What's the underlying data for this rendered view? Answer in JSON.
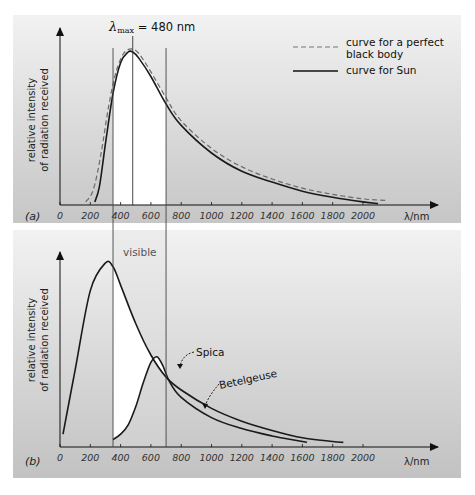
{
  "figure": {
    "colors": {
      "panel_bg_top": "#f0f0f0",
      "panel_bg_bottom": "#c4c4c4",
      "visible_band": "#ffffff",
      "curve": "#1a1a1a",
      "dashed_curve": "#777777"
    }
  },
  "chart_data": [
    {
      "type": "line",
      "panel_label": "(a)",
      "title": "λmax = 480 nm",
      "title_parts": {
        "lambda": "λ",
        "sub": "max",
        "rest": " = 480 nm"
      },
      "xlabel": "λ/nm",
      "ylabel": [
        "relative intensity",
        "of radiation received"
      ],
      "x_ticks": [
        0,
        200,
        400,
        600,
        800,
        1000,
        1200,
        1400,
        1600,
        1800,
        2000
      ],
      "xlim": [
        0,
        2500
      ],
      "grid": false,
      "legend_position": "upper right",
      "legend": [
        {
          "label_lines": [
            "curve for a perfect",
            "black body"
          ],
          "style": "dashed"
        },
        {
          "label_lines": [
            "curve for Sun"
          ],
          "style": "solid"
        }
      ],
      "vertical_lines_nm": [
        350,
        480,
        700
      ],
      "shaded_region_nm": [
        350,
        700
      ],
      "series": [
        {
          "name": "curve for Sun",
          "style": "solid",
          "x": [
            230,
            260,
            300,
            350,
            400,
            450,
            480,
            520,
            600,
            700,
            800,
            1000,
            1200,
            1400,
            1600,
            1800,
            2000,
            2100
          ],
          "y": [
            0.02,
            0.12,
            0.4,
            0.73,
            0.93,
            1.0,
            1.0,
            0.96,
            0.84,
            0.66,
            0.52,
            0.34,
            0.22,
            0.15,
            0.09,
            0.05,
            0.02,
            0.01
          ]
        },
        {
          "name": "curve for a perfect black body",
          "style": "dashed",
          "x": [
            170,
            220,
            270,
            320,
            370,
            420,
            470,
            520,
            600,
            700,
            800,
            1000,
            1200,
            1400,
            1600,
            1800,
            2000,
            2150
          ],
          "y": [
            0.02,
            0.1,
            0.33,
            0.64,
            0.87,
            0.99,
            1.02,
            0.99,
            0.87,
            0.7,
            0.55,
            0.37,
            0.25,
            0.17,
            0.11,
            0.07,
            0.04,
            0.03
          ]
        }
      ]
    },
    {
      "type": "line",
      "panel_label": "(b)",
      "xlabel": "λ/nm",
      "ylabel": [
        "relative intensity",
        "of radiation received"
      ],
      "x_ticks": [
        0,
        200,
        400,
        600,
        800,
        1000,
        1200,
        1400,
        1600,
        1800,
        2000
      ],
      "xlim": [
        0,
        2500
      ],
      "grid": false,
      "annotations": [
        "visible",
        "Spica",
        "Betelgeuse"
      ],
      "vertical_lines_nm": [
        350,
        700
      ],
      "shaded_region_nm": [
        350,
        700
      ],
      "series": [
        {
          "name": "Spica",
          "x": [
            20,
            100,
            200,
            300,
            350,
            400,
            500,
            600,
            700,
            800,
            1000,
            1200,
            1400,
            1600,
            1800,
            1870
          ],
          "y": [
            0.07,
            0.42,
            0.85,
            1.0,
            0.98,
            0.88,
            0.67,
            0.5,
            0.38,
            0.31,
            0.21,
            0.14,
            0.09,
            0.05,
            0.03,
            0.025
          ]
        },
        {
          "name": "Betelgeuse",
          "x": [
            350,
            400,
            450,
            500,
            550,
            600,
            640,
            680,
            720,
            800,
            1000,
            1200,
            1400,
            1600,
            1630
          ],
          "y": [
            0.04,
            0.07,
            0.12,
            0.22,
            0.35,
            0.46,
            0.49,
            0.44,
            0.36,
            0.27,
            0.16,
            0.1,
            0.06,
            0.03,
            0.025
          ]
        }
      ]
    }
  ]
}
